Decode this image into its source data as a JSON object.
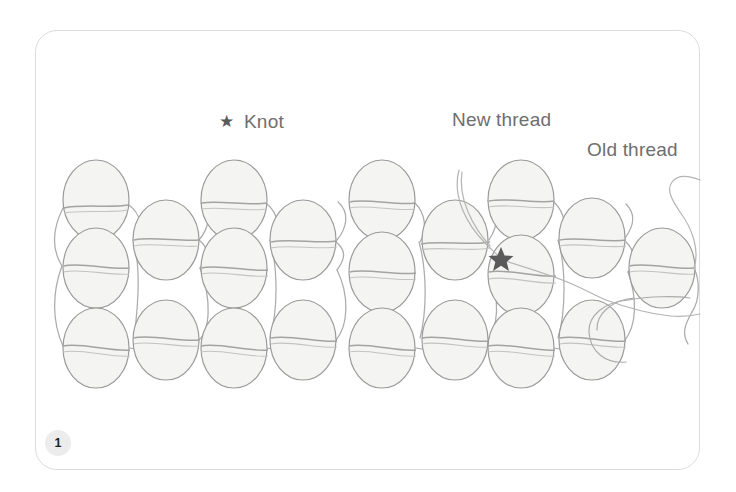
{
  "figure": {
    "number": "1",
    "kind": "beading-stitch-diagram",
    "background_color": "#ffffff",
    "card_border_color": "#dcdcdc"
  },
  "labels": {
    "knot": "Knot",
    "knot_marker_glyph": "★",
    "new_thread": "New thread",
    "old_thread": "Old thread",
    "text_color": "#6e6e6e",
    "star_color": "#5a5a5a"
  },
  "diagram": {
    "bead_fill": "#f4f4f2",
    "bead_stroke": "#9a9a9a",
    "thread_color": "#a8a8a8",
    "bead_rx": 33,
    "bead_ry": 40,
    "columns": [
      {
        "x": 96,
        "beads": [
          200,
          268,
          348
        ],
        "tall": true
      },
      {
        "x": 166,
        "beads": [
          240,
          340
        ],
        "tall": false
      },
      {
        "x": 234,
        "beads": [
          200,
          268,
          348
        ],
        "tall": true
      },
      {
        "x": 303,
        "beads": [
          240,
          340
        ],
        "tall": false
      },
      {
        "x": 382,
        "beads": [
          200,
          272,
          348
        ],
        "tall": true
      },
      {
        "x": 455,
        "beads": [
          240,
          340
        ],
        "tall": false
      },
      {
        "x": 521,
        "beads": [
          200,
          275,
          348
        ],
        "tall": true
      },
      {
        "x": 592,
        "beads": [
          238,
          340
        ],
        "tall": false
      },
      {
        "x": 662,
        "beads": [
          268
        ],
        "tall": false
      }
    ],
    "knot_point": {
      "x": 501,
      "y": 259
    }
  }
}
